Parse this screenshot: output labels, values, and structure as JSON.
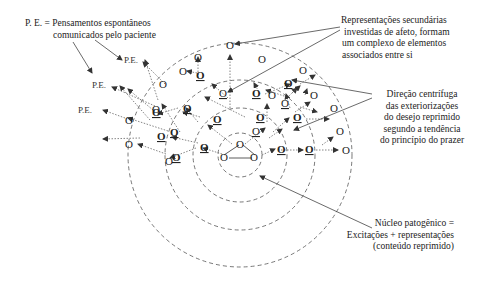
{
  "labels": {
    "pe_legend": [
      "P. E. = Pensamentos espontâneos",
      "comunicados pelo paciente"
    ],
    "secondary": [
      "Representações secundárias",
      "investidas de afeto, formam",
      "um complexo de elementos",
      "associados entre si"
    ],
    "direction": [
      "Direção centrífuga",
      "das exteriorizações",
      "do desejo reprimido",
      "segundo a tendência",
      "do princípio do prazer"
    ],
    "nucleus": [
      "Núcleo patogênico =",
      "Excitações + representações",
      "(conteúdo reprimido)"
    ]
  },
  "pe_nodes": [
    "P.E.",
    "P.E.",
    "P.E."
  ],
  "node_glyph": "O",
  "rings": {
    "center": [
      240,
      155
    ],
    "radii": [
      22,
      47,
      75,
      112
    ]
  },
  "colors": {
    "ink": "#222222",
    "dashed": "#555555",
    "dotted": "#666666"
  }
}
